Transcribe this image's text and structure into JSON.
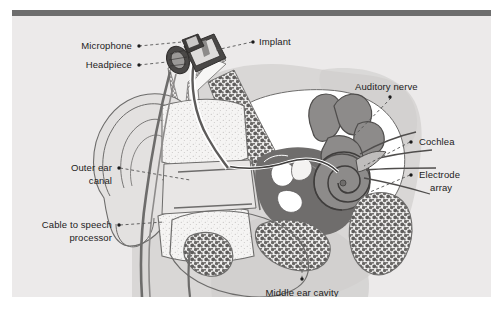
{
  "figure": {
    "background_color": "#eceaea",
    "top_bar_color": "#6e6e6e",
    "text_color": "#1c1c1c",
    "leader_color": "#555555"
  },
  "labels": [
    {
      "id": "microphone",
      "text": "Microphone",
      "align": "right"
    },
    {
      "id": "headpiece",
      "text": "Headpiece",
      "align": "right"
    },
    {
      "id": "implant",
      "text": "Implant",
      "align": "left"
    },
    {
      "id": "auditory_nerve",
      "text": "Auditory nerve",
      "align": "left"
    },
    {
      "id": "cochlea",
      "text": "Cochlea",
      "align": "left"
    },
    {
      "id": "electrode_l1",
      "text": "Electrode",
      "align": "left"
    },
    {
      "id": "electrode_l2",
      "text": "array",
      "align": "left"
    },
    {
      "id": "outer_ear_l1",
      "text": "Outer ear",
      "align": "right"
    },
    {
      "id": "outer_ear_l2",
      "text": "canal",
      "align": "right"
    },
    {
      "id": "cable_l1",
      "text": "Cable to speech",
      "align": "right"
    },
    {
      "id": "cable_l2",
      "text": "processor",
      "align": "right"
    },
    {
      "id": "middle_ear",
      "text": "Middle ear cavity",
      "align": "center"
    }
  ],
  "anatomy": {
    "palette": {
      "head_silhouette": "#d9d7d6",
      "head_shadow": "#cfcdcc",
      "skin_outline": "#6d6c6b",
      "cartilage_fill": "#f3f2f1",
      "bone_fill": "#ffffff",
      "mastoid_stipple": "#6a6866",
      "middle_ear_dark": "#6f6d6c",
      "inner_ear_gray": "#8d8b8a",
      "device_dark": "#4a4847",
      "device_light": "#dedcdb"
    },
    "parts": [
      "pinna",
      "outer-ear-canal",
      "tympanic-membrane",
      "middle-ear-cavity",
      "ossicles",
      "cochlea-spiral",
      "semicircular-canals",
      "auditory-nerve-fibers",
      "mastoid-air-cells",
      "skull-diploe",
      "implant-receiver",
      "headpiece-coil",
      "microphone",
      "electrode-lead",
      "electrode-array",
      "cable-to-speech-processor"
    ]
  }
}
